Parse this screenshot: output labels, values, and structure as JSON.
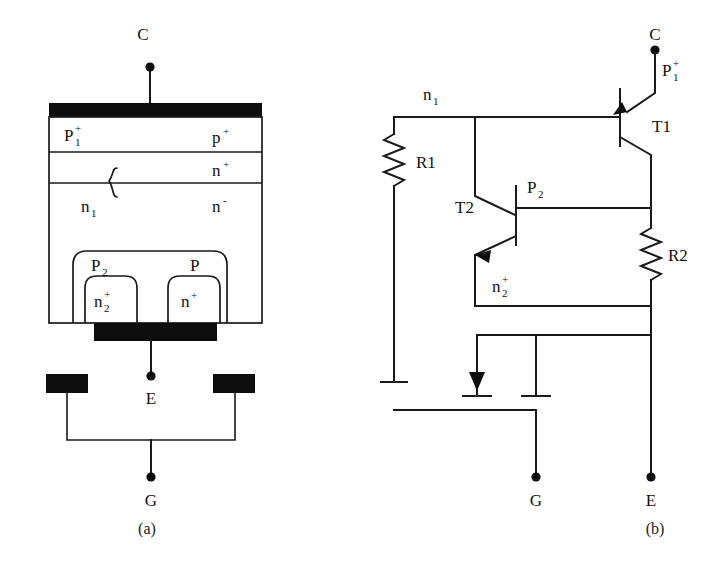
{
  "figure": {
    "captions": [
      {
        "id": "caption-a",
        "text": "(a)",
        "x": 147,
        "y": 534
      },
      {
        "id": "caption-b",
        "text": "(b)",
        "x": 655,
        "y": 534
      }
    ]
  },
  "cross_section": {
    "terminals": [
      {
        "name": "collector",
        "label": "C",
        "x": 150,
        "y": 34
      },
      {
        "name": "emitter",
        "label": "E",
        "x": 151,
        "y": 398
      },
      {
        "name": "gate",
        "label": "G",
        "x": 151,
        "y": 500
      }
    ],
    "layers": [
      {
        "name": "p1-plus-layer",
        "left_label": "P",
        "left_sub": "1",
        "left_sup": "+",
        "right_label": "p",
        "right_sup": "+"
      },
      {
        "name": "n-plus-buffer",
        "right_label": "n",
        "right_sup": "+"
      },
      {
        "name": "n-minus-drift",
        "left_label": "n",
        "left_sub": "1",
        "right_label": "n",
        "right_sup": "-"
      }
    ],
    "wells": [
      {
        "name": "p2-well",
        "label": "P",
        "sub": "2"
      },
      {
        "name": "p-well",
        "label": "P"
      },
      {
        "name": "n2-plus-source",
        "label": "n",
        "sub": "2",
        "sup": "+"
      },
      {
        "name": "n-plus-source",
        "label": "n",
        "sup": "+"
      }
    ],
    "contacts": [
      {
        "name": "top-metal-contact"
      },
      {
        "name": "emitter-metal-contact"
      },
      {
        "name": "gate-metal-left"
      },
      {
        "name": "gate-metal-right"
      }
    ]
  },
  "equivalent_circuit": {
    "terminals": [
      {
        "name": "collector",
        "label": "C",
        "x": 655,
        "y": 34
      },
      {
        "name": "gate",
        "label": "G",
        "x": 536,
        "y": 500
      },
      {
        "name": "emitter",
        "label": "E",
        "x": 651,
        "y": 500
      }
    ],
    "transistors": [
      {
        "name": "T1",
        "label": "T1",
        "type": "pnp",
        "emitter_region": {
          "label": "P",
          "sub": "1",
          "sup": "+"
        }
      },
      {
        "name": "T2",
        "label": "T2",
        "type": "npn",
        "base_region": {
          "label": "P",
          "sub": "2"
        },
        "emitter_region": {
          "label": "n",
          "sub": "2",
          "sup": "+"
        }
      }
    ],
    "resistors": [
      {
        "name": "R1",
        "label": "R1"
      },
      {
        "name": "R2",
        "label": "R2"
      }
    ],
    "nodes": [
      {
        "name": "n1-node",
        "label": "n",
        "sub": "1"
      }
    ],
    "mos_switches": [
      {
        "name": "on-fet-arrow-terminal",
        "kind": "arrow-terminal"
      },
      {
        "name": "off-fet-plain-terminal",
        "kind": "plain-terminal"
      }
    ]
  },
  "colors": {
    "ink": "#1a1a1a",
    "metal": "#0d0d0d",
    "background": "#ffffff"
  }
}
